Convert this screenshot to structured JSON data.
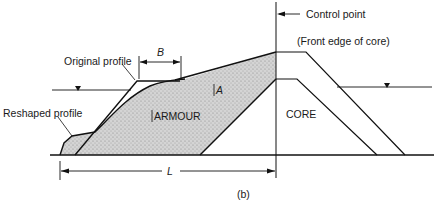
{
  "figure": {
    "caption": "(b)",
    "labels": {
      "control_point": "Control point",
      "front_edge": "(Front edge of core)",
      "original_profile": "Original profile",
      "reshaped_profile": "Reshaped profile",
      "armour": "ARMOUR",
      "core": "CORE",
      "area_a": "A",
      "width_b": "B",
      "length_l": "L"
    },
    "colors": {
      "line": "#111111",
      "armour_fill": "#c9c9c9",
      "background": "#ffffff"
    }
  }
}
